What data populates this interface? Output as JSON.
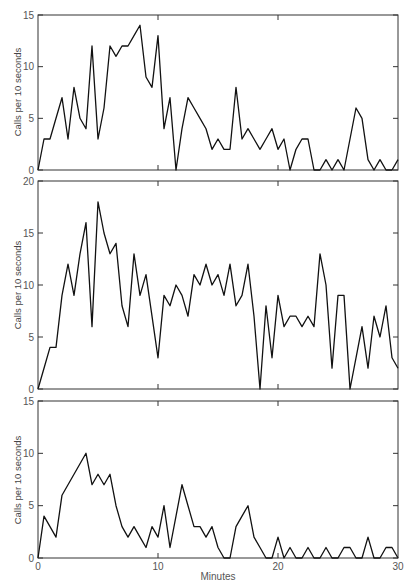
{
  "chart_data": [
    {
      "type": "line",
      "title": "",
      "xlabel": "",
      "ylabel": "Calls per 10 seconds",
      "xlim": [
        0,
        30
      ],
      "ylim": [
        0,
        15
      ],
      "yticks": [
        0,
        5,
        10,
        15
      ],
      "grid": false,
      "x": [
        0,
        0.5,
        1,
        1.5,
        2,
        2.5,
        3,
        3.5,
        4,
        4.5,
        5,
        5.5,
        6,
        6.5,
        7,
        7.5,
        8,
        8.5,
        9,
        9.5,
        10,
        10.5,
        11,
        11.5,
        12,
        12.5,
        13,
        13.5,
        14,
        14.5,
        15,
        15.5,
        16,
        16.5,
        17,
        17.5,
        18,
        18.5,
        19,
        19.5,
        20,
        20.5,
        21,
        21.5,
        22,
        22.5,
        23,
        23.5,
        24,
        24.5,
        25,
        25.5,
        26,
        26.5,
        27,
        27.5,
        28,
        28.5,
        29,
        29.5,
        30
      ],
      "values": [
        0,
        3,
        3,
        5,
        7,
        3,
        8,
        5,
        4,
        12,
        3,
        6,
        12,
        11,
        12,
        12,
        13,
        14,
        9,
        8,
        13,
        4,
        7,
        0,
        4,
        7,
        6,
        5,
        4,
        2,
        3,
        2,
        2,
        8,
        3,
        4,
        3,
        2,
        3,
        4,
        2,
        3,
        0,
        2,
        3,
        3,
        0,
        0,
        1,
        0,
        1,
        0,
        3,
        6,
        5,
        1,
        0,
        1,
        0,
        0,
        1
      ]
    },
    {
      "type": "line",
      "title": "",
      "xlabel": "",
      "ylabel": "Calls per 10 seconds",
      "xlim": [
        0,
        30
      ],
      "ylim": [
        0,
        20
      ],
      "yticks": [
        0,
        5,
        10,
        15,
        20
      ],
      "grid": false,
      "x": [
        0,
        0.5,
        1,
        1.5,
        2,
        2.5,
        3,
        3.5,
        4,
        4.5,
        5,
        5.5,
        6,
        6.5,
        7,
        7.5,
        8,
        8.5,
        9,
        9.5,
        10,
        10.5,
        11,
        11.5,
        12,
        12.5,
        13,
        13.5,
        14,
        14.5,
        15,
        15.5,
        16,
        16.5,
        17,
        17.5,
        18,
        18.5,
        19,
        19.5,
        20,
        20.5,
        21,
        21.5,
        22,
        22.5,
        23,
        23.5,
        24,
        24.5,
        25,
        25.5,
        26,
        26.5,
        27,
        27.5,
        28,
        28.5,
        29,
        29.5,
        30
      ],
      "values": [
        0,
        2,
        4,
        4,
        9,
        12,
        9,
        13,
        16,
        6,
        18,
        15,
        13,
        14,
        8,
        6,
        13,
        9,
        11,
        7,
        3,
        9,
        8,
        10,
        9,
        7,
        11,
        10,
        12,
        10,
        11,
        9,
        12,
        8,
        9,
        12,
        7,
        0,
        8,
        3,
        9,
        6,
        7,
        7,
        6,
        7,
        6,
        13,
        10,
        2,
        9,
        9,
        0,
        3,
        6,
        2,
        7,
        5,
        8,
        3,
        2
      ]
    },
    {
      "type": "line",
      "title": "",
      "xlabel": "Minutes",
      "ylabel": "Calls per 10 seconds",
      "xlim": [
        0,
        30
      ],
      "ylim": [
        0,
        15
      ],
      "xticks": [
        0,
        10,
        20,
        30
      ],
      "yticks": [
        0,
        5,
        10,
        15
      ],
      "grid": false,
      "x": [
        0,
        0.5,
        1,
        1.5,
        2,
        2.5,
        3,
        3.5,
        4,
        4.5,
        5,
        5.5,
        6,
        6.5,
        7,
        7.5,
        8,
        8.5,
        9,
        9.5,
        10,
        10.5,
        11,
        11.5,
        12,
        12.5,
        13,
        13.5,
        14,
        14.5,
        15,
        15.5,
        16,
        16.5,
        17,
        17.5,
        18,
        18.5,
        19,
        19.5,
        20,
        20.5,
        21,
        21.5,
        22,
        22.5,
        23,
        23.5,
        24,
        24.5,
        25,
        25.5,
        26,
        26.5,
        27,
        27.5,
        28,
        28.5,
        29,
        29.5,
        30
      ],
      "values": [
        0,
        4,
        3,
        2,
        6,
        7,
        8,
        9,
        10,
        7,
        8,
        7,
        8,
        5,
        3,
        2,
        3,
        2,
        1,
        3,
        2,
        5,
        1,
        4,
        7,
        5,
        3,
        3,
        2,
        3,
        1,
        0,
        0,
        3,
        4,
        5,
        2,
        1,
        0,
        0,
        2,
        0,
        1,
        0,
        0,
        1,
        0,
        0,
        1,
        0,
        0,
        1,
        1,
        0,
        0,
        2,
        0,
        0,
        1,
        1,
        0
      ]
    }
  ],
  "axes": {
    "ylabel": "Calls per 10 seconds",
    "xlabel": "Minutes",
    "x_ticks": [
      "0",
      "10",
      "20",
      "30"
    ],
    "top_y_ticks": [
      "0",
      "5",
      "10",
      "15"
    ],
    "mid_y_ticks": [
      "0",
      "5",
      "10",
      "15",
      "20"
    ],
    "bot_y_ticks": [
      "0",
      "5",
      "10",
      "15"
    ]
  }
}
